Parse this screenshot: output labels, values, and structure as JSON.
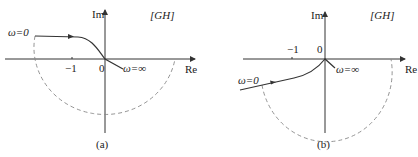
{
  "figure": {
    "panels": [
      {
        "id": "a",
        "caption": "(a)",
        "plane_label": "[GH]",
        "axis_im": "Im",
        "axis_re": "Re",
        "tick_minus_one": "−1",
        "origin_label": "0",
        "omega_start": "ω=0",
        "omega_end": "ω=∞"
      },
      {
        "id": "b",
        "caption": "(b)",
        "plane_label": "[GH]",
        "axis_im": "Im",
        "axis_re": "Re",
        "tick_minus_one": "−1",
        "origin_label": "0",
        "omega_start": "ω=0",
        "omega_end": "ω=∞"
      }
    ]
  }
}
